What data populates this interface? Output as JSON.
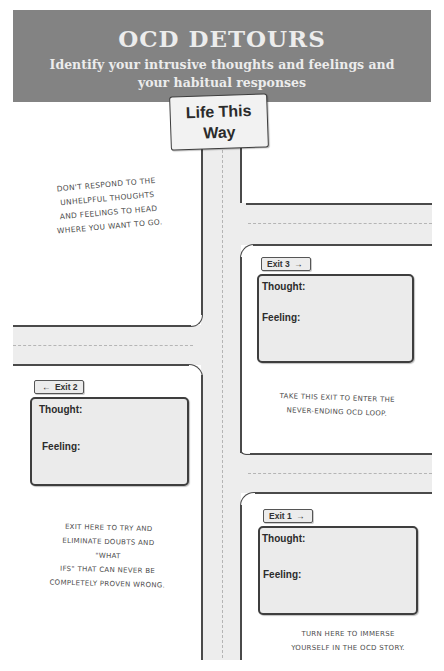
{
  "header": {
    "title": "OCD DETOURS",
    "subtitle": "Identify your intrusive thoughts and feelings and your habitual responses"
  },
  "sign": {
    "line1": "Life This",
    "line2": "Way"
  },
  "notes": {
    "main_road": [
      "DON'T RESPOND TO THE",
      "UNHELPFUL THOUGHTS",
      "AND FEELINGS TO HEAD",
      "WHERE YOU WANT TO GO."
    ],
    "exit3": [
      "TAKE THIS EXIT TO ENTER THE",
      "NEVER-ENDING OCD LOOP."
    ],
    "exit2": [
      "EXIT HERE TO TRY AND",
      "ELIMINATE DOUBTS AND \"WHAT",
      "IFS\" THAT CAN NEVER BE",
      "COMPLETELY PROVEN WRONG."
    ],
    "exit1": [
      "TURN HERE TO IMMERSE",
      "YOURSELF IN THE OCD STORY."
    ]
  },
  "exits": [
    {
      "label": "Exit 3",
      "arrow": "→",
      "direction": "right",
      "thought_label": "Thought:",
      "feeling_label": "Feeling:"
    },
    {
      "label": "Exit 2",
      "arrow": "←",
      "direction": "left",
      "thought_label": "Thought:",
      "feeling_label": "Feeling:"
    },
    {
      "label": "Exit 1",
      "arrow": "→",
      "direction": "right",
      "thought_label": "Thought:",
      "feeling_label": "Feeling:"
    }
  ],
  "colors": {
    "header_bg": "#838383",
    "header_text": "#ececec",
    "road": "#ededed",
    "road_edge": "#4a4a4a",
    "card_bg": "#ebebeb"
  }
}
